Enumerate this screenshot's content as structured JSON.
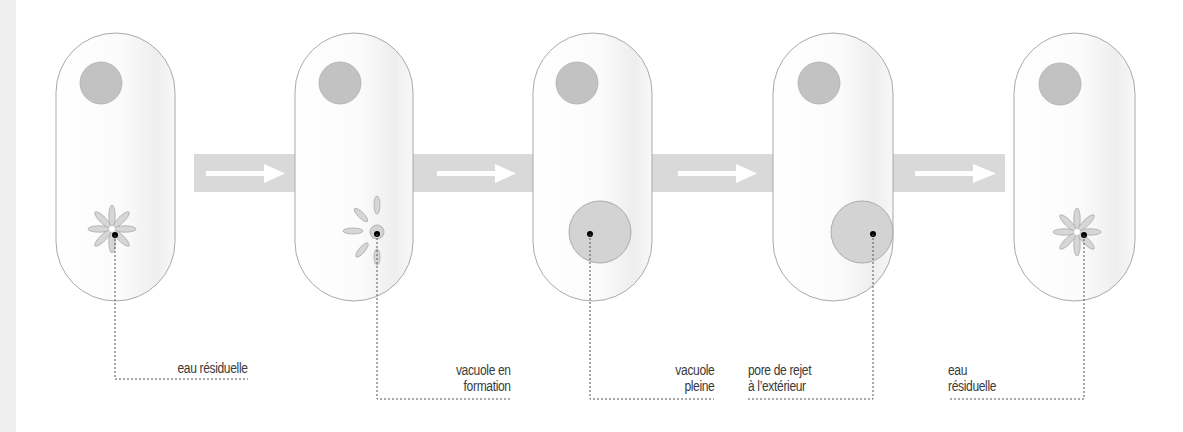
{
  "colors": {
    "background": "#ffffff",
    "left_strip": "#efefef",
    "cell_fill": "#fdfdfd",
    "cell_shade": "#f1f1f1",
    "cell_stroke": "#a9a9a9",
    "nucleus": "#c2c2c2",
    "vacuole_fill": "#d3d3d3",
    "petal_fill": "#d6d6d6",
    "petal_stroke": "#ababab",
    "arrow_band": "#d9d9d9",
    "arrow": "#ffffff",
    "leader": "#555555",
    "dot": "#000000"
  },
  "stages": [
    {
      "id": "1",
      "state": "eau-residuelle-star",
      "label": "eau résiduelle",
      "label_align": "right"
    },
    {
      "id": "2",
      "state": "vacuole-en-formation",
      "label": "vacuole en\nformation",
      "label_align": "right"
    },
    {
      "id": "3",
      "state": "vacuole-pleine",
      "label": "vacuole\npleine",
      "label_align": "right"
    },
    {
      "id": "4",
      "state": "pore-de-rejet",
      "label": "pore de rejet\nà l’extérieur",
      "label_align": "left"
    },
    {
      "id": "5",
      "state": "eau-residuelle-star",
      "label": "eau\nrésiduelle",
      "label_align": "left"
    }
  ],
  "arrows": [
    {
      "from": "1",
      "to": "2",
      "icon": "arrow-right-icon"
    },
    {
      "from": "2",
      "to": "3",
      "icon": "arrow-right-icon"
    },
    {
      "from": "3",
      "to": "4",
      "icon": "arrow-right-icon"
    },
    {
      "from": "4",
      "to": "5",
      "icon": "arrow-right-icon"
    }
  ]
}
